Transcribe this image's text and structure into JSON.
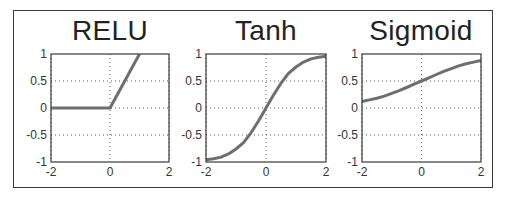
{
  "figure": {
    "background": "#ffffff",
    "frame_color": "#3a3a3a",
    "line_color": "#6e6e6e",
    "grid_color": "#555555"
  },
  "chart_data": [
    {
      "type": "line",
      "title": "RELU",
      "xlabel": "",
      "ylabel": "",
      "xlim": [
        -2,
        2
      ],
      "ylim": [
        -1,
        1
      ],
      "xticks": [
        -2,
        0,
        2
      ],
      "xtick_labels": [
        "-2",
        "0",
        "2"
      ],
      "yticks": [
        1,
        0.5,
        0,
        -0.5,
        -1
      ],
      "ytick_labels": [
        "1",
        "0.5",
        "0",
        "-0.5",
        "-1"
      ],
      "grid": "dotted",
      "x": [
        -2,
        -1.5,
        -1,
        -0.5,
        0,
        0.25,
        0.5,
        0.75,
        1
      ],
      "y": [
        0,
        0,
        0,
        0,
        0,
        0.25,
        0.5,
        0.75,
        1
      ]
    },
    {
      "type": "line",
      "title": "Tanh",
      "xlabel": "",
      "ylabel": "",
      "xlim": [
        -2,
        2
      ],
      "ylim": [
        -1,
        1
      ],
      "xticks": [
        -2,
        0,
        2
      ],
      "xtick_labels": [
        "-2",
        "0",
        "2"
      ],
      "yticks": [
        1,
        0.5,
        0,
        -0.5,
        -1
      ],
      "ytick_labels": [
        "1",
        "0.5",
        "0",
        "-0.5",
        "-1"
      ],
      "grid": "dotted",
      "x": [
        -2,
        -1.75,
        -1.5,
        -1.25,
        -1,
        -0.75,
        -0.5,
        -0.25,
        0,
        0.25,
        0.5,
        0.75,
        1,
        1.25,
        1.5,
        1.75,
        2
      ],
      "y": [
        -0.96,
        -0.94,
        -0.91,
        -0.85,
        -0.76,
        -0.64,
        -0.46,
        -0.24,
        0,
        0.24,
        0.46,
        0.64,
        0.76,
        0.85,
        0.91,
        0.94,
        0.96
      ]
    },
    {
      "type": "line",
      "title": "Sigmoid",
      "xlabel": "",
      "ylabel": "",
      "xlim": [
        -2,
        2
      ],
      "ylim": [
        -1,
        1
      ],
      "xticks": [
        -2,
        0,
        2
      ],
      "xtick_labels": [
        "-2",
        "0",
        "2"
      ],
      "yticks": [
        1,
        0.5,
        0,
        -0.5,
        -1
      ],
      "ytick_labels": [
        "1",
        "0.5",
        "0",
        "-0.5",
        "-1"
      ],
      "grid": "dotted",
      "x": [
        -2,
        -1.75,
        -1.5,
        -1.25,
        -1,
        -0.75,
        -0.5,
        -0.25,
        0,
        0.25,
        0.5,
        0.75,
        1,
        1.25,
        1.5,
        1.75,
        2
      ],
      "y": [
        0.12,
        0.15,
        0.18,
        0.22,
        0.27,
        0.32,
        0.38,
        0.44,
        0.5,
        0.56,
        0.62,
        0.68,
        0.73,
        0.78,
        0.82,
        0.85,
        0.88
      ]
    }
  ]
}
